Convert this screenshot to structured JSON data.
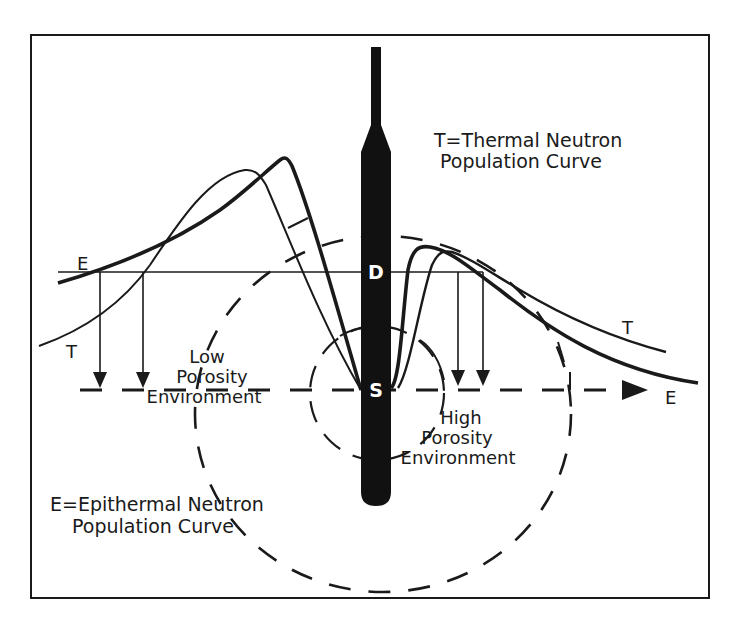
{
  "figure": {
    "legend": {
      "thermal": {
        "line1": "T=Thermal Neutron",
        "line2": "Population Curve"
      },
      "epithermal": {
        "line1": "E=Epithermal Neutron",
        "line2": "Population Curve"
      }
    },
    "probe": {
      "detector_label": "D",
      "source_label": "S"
    },
    "curve_labels": {
      "left_E": "E",
      "left_T": "T",
      "right_T": "T",
      "axis_E": "E"
    },
    "regions": {
      "low": {
        "line1": "Low",
        "line2": "Porosity",
        "line3": "Environment"
      },
      "high": {
        "line1": "High",
        "line2": "Porosity",
        "line3": "Environment"
      }
    },
    "colors": {
      "ink": "#1a1a1a",
      "background": "#ffffff"
    }
  }
}
